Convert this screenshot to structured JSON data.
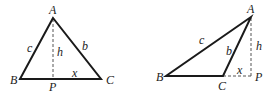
{
  "diagrams": [
    {
      "name": "acute-triangle",
      "labels": {
        "A": "A",
        "B": "B",
        "C": "C",
        "P": "P",
        "a_side": "",
        "b": "b",
        "c": "c",
        "h": "h",
        "x": "x"
      }
    },
    {
      "name": "obtuse-triangle",
      "labels": {
        "A": "A",
        "B": "B",
        "C": "C",
        "P": "P",
        "b": "b",
        "c": "c",
        "h": "h",
        "x": "x"
      }
    }
  ]
}
